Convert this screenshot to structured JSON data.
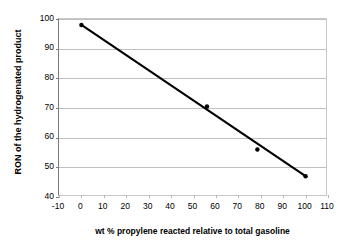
{
  "chart_data": {
    "type": "scatter",
    "title": "",
    "xlabel": "wt % propylene reacted relative to total gasoline",
    "ylabel": "RON of the hydrogenated product",
    "xlim": [
      -10,
      110
    ],
    "ylim": [
      40,
      100
    ],
    "xticks": [
      -10,
      0,
      10,
      20,
      30,
      40,
      50,
      60,
      70,
      80,
      90,
      100,
      110
    ],
    "xtick_labels": [
      "-10",
      "0",
      "10",
      "20",
      "30",
      "40",
      "50",
      "60",
      "70",
      "80",
      "90",
      "100",
      "110"
    ],
    "yticks": [
      40,
      50,
      60,
      70,
      80,
      90,
      100
    ],
    "ytick_labels": [
      "40",
      "50",
      "60",
      "70",
      "80",
      "90",
      "100"
    ],
    "grid": "horizontal",
    "legend": "none",
    "marker_color": "#000000",
    "line_color": "#000000",
    "grid_color": "#c0c0c0",
    "axis_color": "#7a7a7a",
    "series": [
      {
        "name": "RON vs wt % propylene reacted",
        "points": [
          {
            "x": 0,
            "y": 98.0
          },
          {
            "x": 56,
            "y": 70.5
          },
          {
            "x": 78.5,
            "y": 56.0
          },
          {
            "x": 100,
            "y": 47.0
          }
        ]
      }
    ],
    "trendline": {
      "name": "linear fit",
      "x": [
        0,
        100
      ],
      "y": [
        98.0,
        47.0
      ]
    }
  }
}
